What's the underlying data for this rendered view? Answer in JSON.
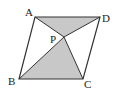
{
  "diagram": {
    "type": "geometry",
    "points": {
      "A": {
        "label": "A",
        "x": 35,
        "y": 17
      },
      "D": {
        "label": "D",
        "x": 100,
        "y": 17
      },
      "B": {
        "label": "B",
        "x": 19,
        "y": 79
      },
      "C": {
        "label": "C",
        "x": 83,
        "y": 79
      },
      "P": {
        "label": "P",
        "x": 64,
        "y": 37
      }
    },
    "shaded_regions": [
      "APD",
      "BPC"
    ],
    "colors": {
      "stroke": "#333333",
      "fill": "#c8c8c8",
      "background": "#ffffff"
    }
  }
}
